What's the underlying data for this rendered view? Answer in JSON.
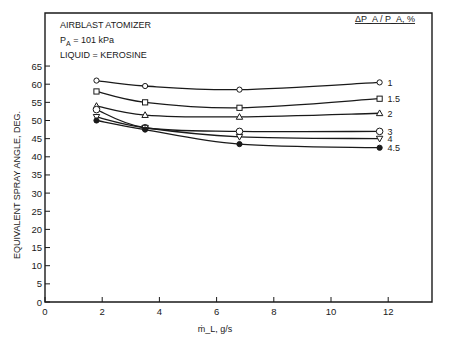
{
  "chart_data": {
    "type": "line",
    "title": "",
    "annotations": [
      "AIRBLAST ATOMIZER",
      "P_A = 101 kPa",
      "LIQUID = KEROSINE"
    ],
    "xlabel": "ṁ_L, g/s",
    "ylabel": "EQUIVALENT SPRAY ANGLE, DEG.",
    "xlim": [
      0,
      13.3
    ],
    "ylim": [
      0,
      65
    ],
    "xticks": [
      0,
      2,
      4,
      6,
      8,
      10,
      12
    ],
    "yticks": [
      0,
      5,
      10,
      15,
      20,
      25,
      30,
      35,
      40,
      45,
      50,
      55,
      60,
      65
    ],
    "grid": false,
    "legend_title": "ΔP_A / P_A, %",
    "legend_position": "right, labels at line ends",
    "x": [
      1.8,
      3.5,
      6.8,
      11.7
    ],
    "series": [
      {
        "name": "1",
        "marker": "circle-open",
        "values": [
          61,
          59.5,
          58.5,
          60.5
        ]
      },
      {
        "name": "1.5",
        "marker": "square-open",
        "values": [
          58,
          55,
          53.5,
          56
        ]
      },
      {
        "name": "2",
        "marker": "triangle-up-open",
        "values": [
          54,
          51.5,
          51,
          52
        ]
      },
      {
        "name": "3",
        "marker": "circle-open-large",
        "values": [
          53,
          48,
          47,
          47
        ]
      },
      {
        "name": "4",
        "marker": "triangle-down-open",
        "values": [
          51,
          48,
          45.5,
          45
        ]
      },
      {
        "name": "4.5",
        "marker": "circle-filled",
        "values": [
          50,
          47.5,
          43.5,
          42.5
        ]
      }
    ]
  },
  "labels": {
    "annotation_1": "AIRBLAST ATOMIZER",
    "annotation_2_main": "P",
    "annotation_2_sub": "A",
    "annotation_2_rest": " = 101 kPa",
    "annotation_3": "LIQUID = KEROSINE",
    "legend_title": "ΔP_A / P_A, %",
    "xlabel": "ṁ_L, g/s",
    "ylabel": "EQUIVALENT SPRAY ANGLE, DEG."
  }
}
